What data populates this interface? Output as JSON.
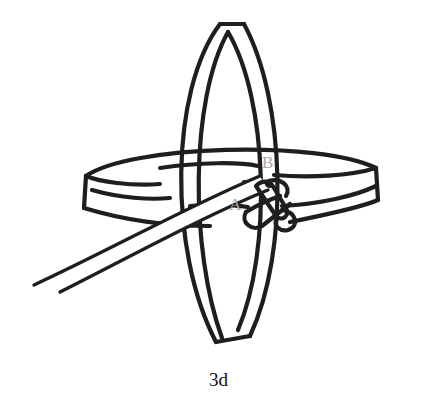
{
  "figure": {
    "caption": "3d",
    "labels": {
      "a": "A",
      "b": "B"
    },
    "colors": {
      "ink": "#1e1e1e",
      "label": "#a8a8a8",
      "background": "#ffffff"
    }
  }
}
